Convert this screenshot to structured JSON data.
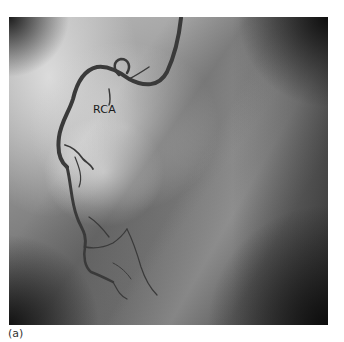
{
  "figure": {
    "type": "coronary-angiogram",
    "label": "RCA",
    "caption": "(a)"
  },
  "colors": {
    "background": "#ffffff",
    "image_mid_gray": "#7c7c7c",
    "vessel": "#3a3a3a",
    "label_text": "#1a1a1a"
  }
}
